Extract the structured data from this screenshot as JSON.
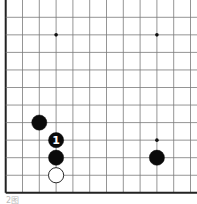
{
  "board": {
    "grid": {
      "origin_x": 5.7,
      "origin_y": 17.3,
      "col_spacing": 16.8,
      "row_spacing": 17.55,
      "cols": 12,
      "rows": 11,
      "line_color": "#7a7a7a",
      "edge_color": "#222222"
    },
    "star_points": [
      {
        "col": 3,
        "row": 1
      },
      {
        "col": 9,
        "row": 1
      },
      {
        "col": 9,
        "row": 7
      }
    ],
    "stones": [
      {
        "color": "black",
        "col": 2,
        "row": 6,
        "label": ""
      },
      {
        "color": "black",
        "col": 3,
        "row": 7,
        "label": "1"
      },
      {
        "color": "black",
        "col": 3,
        "row": 8,
        "label": ""
      },
      {
        "color": "white",
        "col": 3,
        "row": 9,
        "label": ""
      },
      {
        "color": "black",
        "col": 9,
        "row": 8,
        "label": ""
      }
    ]
  },
  "caption": "2图"
}
